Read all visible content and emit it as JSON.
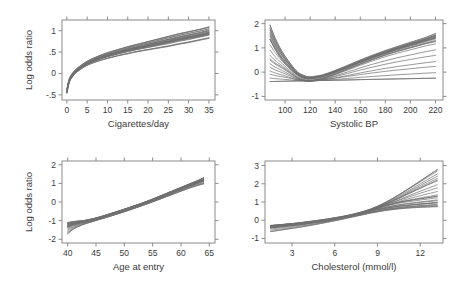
{
  "figure": {
    "title": "",
    "layout": "2x2 panel grid",
    "width": 456,
    "height": 289,
    "background_color": "#ffffff",
    "curve_color": "#6f6f6f",
    "axis_color": "#8a8a8a",
    "text_color": "#3a3a3a"
  },
  "chart_data": [
    {
      "id": "cigarettes",
      "type": "line",
      "title": "",
      "xlabel": "Cigarettes/day",
      "ylabel": "Log odds ratio",
      "xlim": [
        -1.2,
        36.5
      ],
      "ylim": [
        -0.62,
        1.25
      ],
      "xticks": [
        0,
        5,
        10,
        15,
        20,
        25,
        30,
        35
      ],
      "xticklabels": [
        "0",
        "5",
        "10",
        "15",
        "20",
        "25",
        "30",
        "35"
      ],
      "yticks": [
        -0.5,
        0,
        0.5,
        1
      ],
      "yticklabels": [
        "-.5",
        "0",
        ".5",
        "1"
      ],
      "grid": false,
      "legend": "none",
      "n_curves": 20,
      "x": [
        0,
        0.5,
        1,
        2,
        3,
        5,
        7.5,
        10,
        12.5,
        15,
        17.5,
        20,
        22.5,
        25,
        27.5,
        30,
        32.5,
        35
      ],
      "series": [
        {
          "name": "bootstrap-curve-median",
          "values": [
            -0.42,
            -0.2,
            -0.09,
            0.03,
            0.11,
            0.23,
            0.33,
            0.41,
            0.48,
            0.54,
            0.59,
            0.64,
            0.69,
            0.74,
            0.79,
            0.84,
            0.88,
            0.93
          ]
        },
        {
          "name": "bootstrap-curve-upper",
          "values": [
            -0.38,
            -0.16,
            -0.05,
            0.07,
            0.15,
            0.28,
            0.39,
            0.48,
            0.55,
            0.62,
            0.68,
            0.74,
            0.8,
            0.86,
            0.92,
            0.97,
            1.02,
            1.08
          ]
        },
        {
          "name": "bootstrap-curve-lower",
          "values": [
            -0.46,
            -0.24,
            -0.13,
            -0.01,
            0.07,
            0.19,
            0.28,
            0.35,
            0.41,
            0.46,
            0.51,
            0.55,
            0.59,
            0.63,
            0.68,
            0.72,
            0.77,
            0.82
          ]
        }
      ]
    },
    {
      "id": "systolic-bp",
      "type": "line",
      "title": "",
      "xlabel": "Systolic BP",
      "ylabel": "",
      "xlim": [
        84,
        226
      ],
      "ylim": [
        -1.15,
        2.15
      ],
      "xticks": [
        100,
        120,
        140,
        160,
        180,
        200,
        220
      ],
      "xticklabels": [
        "100",
        "120",
        "140",
        "160",
        "180",
        "200",
        "220"
      ],
      "yticks": [
        -1,
        0,
        1,
        2
      ],
      "yticklabels": [
        "-1",
        "0",
        "1",
        "2"
      ],
      "grid": false,
      "legend": "none",
      "n_curves": 20,
      "x": [
        88,
        92,
        96,
        100,
        105,
        110,
        115,
        120,
        130,
        140,
        150,
        160,
        170,
        180,
        190,
        200,
        210,
        220
      ],
      "series": [
        {
          "name": "bootstrap-curve-median",
          "values": [
            1.35,
            0.95,
            0.62,
            0.36,
            0.1,
            -0.12,
            -0.24,
            -0.27,
            -0.18,
            0.0,
            0.2,
            0.41,
            0.6,
            0.78,
            0.95,
            1.1,
            1.25,
            1.4
          ]
        },
        {
          "name": "bootstrap-curve-upper",
          "values": [
            1.95,
            1.42,
            1.0,
            0.66,
            0.3,
            0.0,
            -0.14,
            -0.2,
            -0.12,
            0.06,
            0.27,
            0.49,
            0.69,
            0.88,
            1.05,
            1.22,
            1.38,
            1.58
          ]
        },
        {
          "name": "bootstrap-curve-lower",
          "values": [
            0.55,
            0.38,
            0.25,
            0.12,
            -0.06,
            -0.24,
            -0.33,
            -0.36,
            -0.26,
            -0.08,
            0.12,
            0.33,
            0.52,
            0.7,
            0.86,
            1.0,
            1.14,
            1.26
          ]
        },
        {
          "name": "linear-reference",
          "values": [
            -0.39,
            -0.385,
            -0.38,
            -0.375,
            -0.37,
            -0.365,
            -0.36,
            -0.355,
            -0.345,
            -0.335,
            -0.325,
            -0.31,
            -0.3,
            -0.29,
            -0.28,
            -0.27,
            -0.26,
            -0.25
          ]
        }
      ]
    },
    {
      "id": "age-at-entry",
      "type": "line",
      "title": "",
      "xlabel": "Age at entry",
      "ylabel": "Log odds ratio",
      "xlim": [
        39,
        66
      ],
      "ylim": [
        -2.2,
        2.2
      ],
      "xticks": [
        40,
        45,
        50,
        55,
        60,
        65
      ],
      "xticklabels": [
        "40",
        "45",
        "50",
        "55",
        "60",
        "65"
      ],
      "yticks": [
        -2,
        -1,
        0,
        1,
        2
      ],
      "yticklabels": [
        "-2",
        "-1",
        "0",
        "1",
        "2"
      ],
      "grid": false,
      "legend": "none",
      "n_curves": 20,
      "x": [
        40,
        41,
        42,
        43,
        45,
        47,
        49,
        51,
        53,
        55,
        57,
        59,
        61,
        63,
        64
      ],
      "series": [
        {
          "name": "bootstrap-curve-median",
          "values": [
            -1.35,
            -1.22,
            -1.14,
            -1.07,
            -0.92,
            -0.74,
            -0.55,
            -0.35,
            -0.14,
            0.08,
            0.32,
            0.56,
            0.8,
            1.02,
            1.12
          ]
        },
        {
          "name": "bootstrap-curve-upper",
          "values": [
            -1.1,
            -1.05,
            -1.02,
            -0.99,
            -0.86,
            -0.68,
            -0.49,
            -0.29,
            -0.08,
            0.15,
            0.4,
            0.65,
            0.9,
            1.15,
            1.3
          ]
        },
        {
          "name": "bootstrap-curve-lower",
          "values": [
            -1.7,
            -1.45,
            -1.3,
            -1.18,
            -0.99,
            -0.81,
            -0.62,
            -0.42,
            -0.21,
            0.01,
            0.24,
            0.47,
            0.7,
            0.9,
            0.98
          ]
        }
      ]
    },
    {
      "id": "cholesterol",
      "type": "line",
      "title": "",
      "xlabel": "Cholesterol (mmol/l)",
      "ylabel": "",
      "xlim": [
        1.1,
        13.6
      ],
      "ylim": [
        -1.25,
        3.25
      ],
      "xticks": [
        3,
        6,
        9,
        12
      ],
      "xticklabels": [
        "3",
        "6",
        "9",
        "12"
      ],
      "yticks": [
        -1,
        0,
        1,
        2,
        3
      ],
      "yticklabels": [
        "-1",
        "0",
        "1",
        "2",
        "3"
      ],
      "grid": false,
      "legend": "none",
      "n_curves": 20,
      "x": [
        1.5,
        2.5,
        3.5,
        4.5,
        5.5,
        6.5,
        7.5,
        8.5,
        9.5,
        10.5,
        11.5,
        12.5,
        13.2
      ],
      "series": [
        {
          "name": "bootstrap-curve-steep",
          "values": [
            -0.3,
            -0.22,
            -0.14,
            -0.04,
            0.07,
            0.2,
            0.37,
            0.6,
            0.95,
            1.4,
            1.9,
            2.42,
            2.78
          ]
        },
        {
          "name": "bootstrap-curve-mid-steep",
          "values": [
            -0.42,
            -0.33,
            -0.24,
            -0.13,
            -0.01,
            0.14,
            0.32,
            0.56,
            0.86,
            1.2,
            1.58,
            1.95,
            2.2
          ]
        },
        {
          "name": "bootstrap-curve-median",
          "values": [
            -0.35,
            -0.28,
            -0.2,
            -0.1,
            0.02,
            0.16,
            0.33,
            0.54,
            0.78,
            0.98,
            1.12,
            1.24,
            1.32
          ]
        },
        {
          "name": "bootstrap-curve-flat",
          "values": [
            -0.28,
            -0.22,
            -0.15,
            -0.06,
            0.04,
            0.17,
            0.32,
            0.5,
            0.66,
            0.78,
            0.86,
            0.93,
            0.98
          ]
        },
        {
          "name": "bootstrap-curve-lower",
          "values": [
            -0.62,
            -0.5,
            -0.38,
            -0.25,
            -0.1,
            0.06,
            0.23,
            0.4,
            0.54,
            0.64,
            0.7,
            0.74,
            0.76
          ]
        }
      ]
    }
  ]
}
